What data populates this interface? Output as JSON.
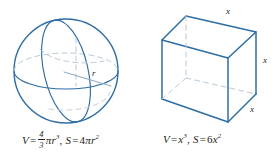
{
  "figure": {
    "caption_style": "geometry-solids",
    "stroke_color": "#2e6da4",
    "hidden_stroke_color": "#9fb6c9",
    "text_color": "#231f20"
  },
  "sphere": {
    "name": "sphere",
    "radius_label": "r",
    "formula": {
      "volume_var": "V",
      "equals": "=",
      "frac_numerator": "4",
      "frac_denominator": "3",
      "pi": "π",
      "radius_var": "r",
      "radius_exp": "3",
      "separator": ",",
      "surface_var": "S",
      "surface_equals": "=",
      "surface_coef": "4",
      "surface_pi": "π",
      "surface_radius_var": "r",
      "surface_exp": "2"
    }
  },
  "cube": {
    "name": "cube",
    "edge_label_top": "x",
    "edge_label_right": "x",
    "edge_label_front": "x",
    "formula": {
      "volume_var": "V",
      "equals": "=",
      "side_var": "x",
      "side_exp": "3",
      "separator": ",",
      "surface_var": "S",
      "surface_equals": "=",
      "surface_coef": "6",
      "surface_side_var": "x",
      "surface_exp": "2"
    }
  }
}
